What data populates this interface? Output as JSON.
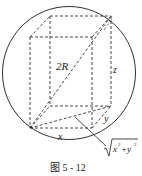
{
  "figure": {
    "caption": "图 5 - 12",
    "labels": {
      "diagonal": "2R",
      "height": "z",
      "width": "x",
      "depth": "y",
      "base_diagonal_x": "x",
      "base_diagonal_plus": "+y",
      "sup2": "2"
    },
    "colors": {
      "stroke": "#1a1a1a",
      "background": "#ffffff"
    }
  }
}
